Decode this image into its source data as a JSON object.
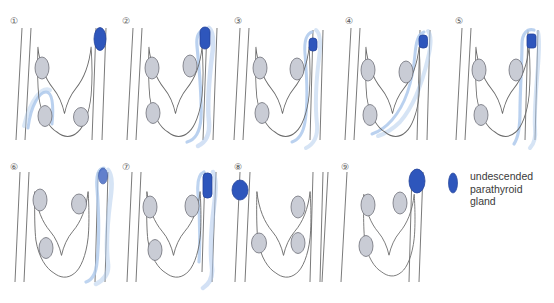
{
  "figure": {
    "title": "",
    "type": "medical-diagram",
    "background_color": "#ffffff",
    "colors": {
      "undescended_gland": "#2E56BC",
      "undescended_gland_dark": "#23439A",
      "normal_gland_fill": "#C9CCD5",
      "normal_gland_stroke": "#6E7078",
      "tract": "#A9C7EC",
      "tract_light": "#CBDDF4",
      "outline": "#6B6B6B",
      "text": "#3a3a3a"
    },
    "panel_count": 9
  },
  "panels": [
    {
      "id": "1",
      "label": "①",
      "gland_position": "right-upper-outside",
      "gland_shape": "oval",
      "has_tract": true,
      "tract_shape": "short-loop-lower-left"
    },
    {
      "id": "2",
      "label": "②",
      "gland_position": "right-upper",
      "gland_shape": "oval",
      "has_tract": true,
      "tract_shape": "long-descending-loop"
    },
    {
      "id": "3",
      "label": "③",
      "gland_position": "right-upper",
      "gland_shape": "small-oval",
      "has_tract": true,
      "tract_shape": "long-descending-loop"
    },
    {
      "id": "4",
      "label": "④",
      "gland_position": "right-upper",
      "gland_shape": "small-oval",
      "has_tract": true,
      "tract_shape": "descending-diagonal"
    },
    {
      "id": "5",
      "label": "⑤",
      "gland_position": "right-upper",
      "gland_shape": "rectangle",
      "has_tract": true,
      "tract_shape": "hairpin-loop"
    },
    {
      "id": "6",
      "label": "⑥",
      "gland_position": "right-upper",
      "gland_shape": "small-faded-oval",
      "has_tract": true,
      "tract_shape": "long-loop"
    },
    {
      "id": "7",
      "label": "⑦",
      "gland_position": "right-upper",
      "gland_shape": "rectangle",
      "has_tract": true,
      "tract_shape": "long-descending"
    },
    {
      "id": "8",
      "label": "⑧",
      "gland_position": "left-upper",
      "gland_shape": "round-oval",
      "has_tract": false,
      "tract_shape": ""
    },
    {
      "id": "9",
      "label": "⑨",
      "gland_position": "right-upper",
      "gland_shape": "oval",
      "has_tract": false,
      "tract_shape": ""
    }
  ],
  "legend": {
    "marker_shape": "oval",
    "marker_color": "#2E56BC",
    "line1": "undescended",
    "line2": "parathyroid",
    "line3": "gland"
  }
}
